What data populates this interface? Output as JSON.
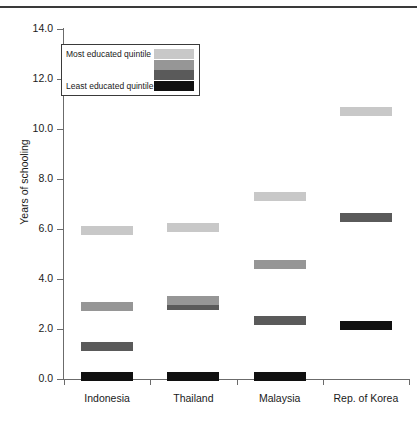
{
  "figure": {
    "clipped_title": "Education distribution by quintile",
    "has_top_rule": true
  },
  "legend": {
    "top_label": "Most educated quintile",
    "bottom_label": "Least educated quintile",
    "swatches": [
      "#c8c8c8",
      "#969696",
      "#5a5a5a",
      "#101010"
    ]
  },
  "colors": {
    "quintile_5_most": "#c8c8c8",
    "quintile_4": "#969696",
    "quintile_2": "#5a5a5a",
    "quintile_1_least": "#101010",
    "axis": "#6b6b6b",
    "text": "#1a1a1a",
    "background": "#ffffff"
  },
  "chart_data": {
    "type": "bar",
    "title": "Education distribution by quintile",
    "xlabel": "",
    "ylabel": "Years of schooling",
    "ylim": [
      0.0,
      14.0
    ],
    "yticks": [
      "0.0",
      "2.0",
      "4.0",
      "6.0",
      "8.0",
      "10.0",
      "12.0",
      "14.0"
    ],
    "ytick_values": [
      0.0,
      2.0,
      4.0,
      6.0,
      8.0,
      10.0,
      12.0,
      14.0
    ],
    "grid": false,
    "legend_position": "upper-left",
    "categories": [
      "Indonesia",
      "Thailand",
      "Malaysia",
      "Rep. of Korea"
    ],
    "series": [
      {
        "name": "Most educated quintile",
        "color": "#c8c8c8",
        "values": [
          5.95,
          6.05,
          7.3,
          10.7
        ]
      },
      {
        "name": "Second quintile",
        "color": "#969696",
        "values": [
          2.9,
          3.15,
          4.6,
          null
        ]
      },
      {
        "name": "Third quintile",
        "color": "#5a5a5a",
        "values": [
          1.3,
          2.95,
          2.35,
          6.45
        ]
      },
      {
        "name": "Least educated quintile",
        "color": "#101010",
        "values": [
          0.1,
          0.1,
          0.1,
          2.15
        ]
      }
    ]
  }
}
